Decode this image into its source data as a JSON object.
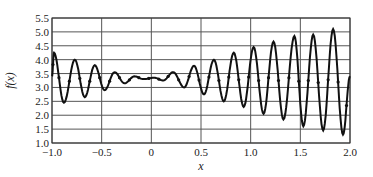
{
  "chart_data": {
    "type": "line",
    "title": "",
    "xlabel": "x",
    "ylabel": "f(x)",
    "xlim": [
      -1.0,
      2.0
    ],
    "ylim": [
      1.0,
      5.5
    ],
    "grid": true,
    "legend": null,
    "x_ticks": [
      "-1.0",
      "-0.5",
      "0",
      "0.5",
      "1.0",
      "1.5",
      "2.0"
    ],
    "y_ticks": [
      "1.0",
      "1.5",
      "2.0",
      "2.5",
      "3.0",
      "3.5",
      "4.0",
      "4.5",
      "5.0",
      "5.5"
    ],
    "series": [
      {
        "name": "f(x)",
        "color": "#111111",
        "markers": "small dots on curve",
        "x": [
          -1.0,
          -0.98,
          -0.88,
          -0.77,
          -0.67,
          -0.57,
          -0.47,
          -0.37,
          -0.27,
          -0.17,
          -0.08,
          0.03,
          0.12,
          0.22,
          0.33,
          0.43,
          0.53,
          0.63,
          0.73,
          0.83,
          0.93,
          1.03,
          1.13,
          1.23,
          1.33,
          1.44,
          1.53,
          1.63,
          1.73,
          1.83,
          1.93,
          2.0
        ],
        "y": [
          3.4,
          4.25,
          2.45,
          4.0,
          2.65,
          3.8,
          2.9,
          3.55,
          3.15,
          3.4,
          3.3,
          3.35,
          3.25,
          3.55,
          3.0,
          3.78,
          2.75,
          4.0,
          2.5,
          4.25,
          2.3,
          4.45,
          2.05,
          4.65,
          1.85,
          4.85,
          1.6,
          4.9,
          1.45,
          5.1,
          1.3,
          3.4
        ]
      }
    ]
  },
  "axes": {
    "x_label": "x",
    "y_label": "f(x)"
  }
}
